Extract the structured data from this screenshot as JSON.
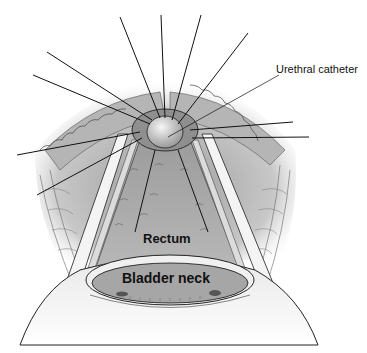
{
  "figure": {
    "type": "anatomical-surgical-illustration",
    "labels": {
      "urethral_catheter": "Urethral catheter",
      "rectum": "Rectum",
      "bladder_neck": "Bladder neck"
    },
    "colors": {
      "background": "#ffffff",
      "ink": "#111111",
      "tissue_light": "#d9d9d9",
      "tissue_mid": "#a8a8a8",
      "tissue_dark": "#7a7a7a",
      "catheter_tip": "#e6e6e6"
    },
    "sutures": {
      "center": [
        165,
        128
      ],
      "endpoints": [
        [
          120,
          17
        ],
        [
          161,
          15
        ],
        [
          201,
          15
        ],
        [
          248,
          33
        ],
        [
          47,
          52
        ],
        [
          33,
          75
        ],
        [
          17,
          155
        ],
        [
          37,
          195
        ],
        [
          293,
          122
        ],
        [
          309,
          137
        ]
      ]
    },
    "leader_line": {
      "from": [
        168,
        137
      ],
      "to": [
        279,
        75
      ]
    }
  }
}
